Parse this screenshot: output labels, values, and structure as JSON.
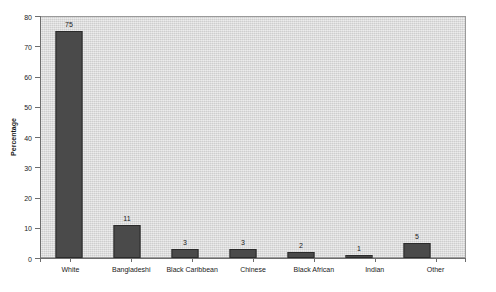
{
  "chart_data": {
    "type": "bar",
    "title": "",
    "xlabel": "",
    "ylabel": "Percentage",
    "categories": [
      "White",
      "Bangladeshi",
      "Black Caribbean",
      "Chinese",
      "Black African",
      "Indian",
      "Other"
    ],
    "values": [
      75,
      11,
      3,
      3,
      2,
      1,
      5
    ],
    "value_labels": [
      "75",
      "11",
      "3",
      "3",
      "2",
      "1",
      "5"
    ],
    "ylim": [
      0,
      80
    ],
    "yticks": [
      0,
      10,
      20,
      30,
      40,
      50,
      60,
      70,
      80
    ],
    "ytick_labels": [
      "0",
      "10",
      "20",
      "30",
      "40",
      "50",
      "60",
      "70",
      "80"
    ],
    "grid": false,
    "legend": false,
    "legend_position": "none",
    "colors": {
      "bar_fill": "#4a4a4a",
      "bar_border": "#2b2b2b",
      "plot_background": "#dcdcdc",
      "axis_line": "#6d6d6d",
      "text": "#1a1a1a",
      "page_background": "#ffffff"
    }
  }
}
